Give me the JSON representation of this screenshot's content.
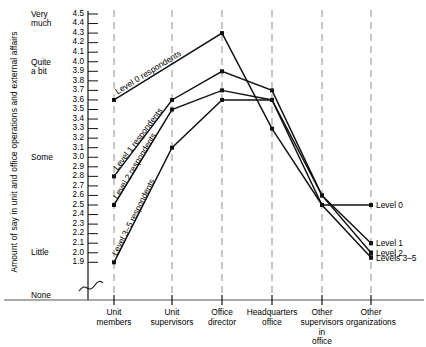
{
  "chart_data": {
    "type": "line",
    "title": "",
    "ylabel": "Amount of say in unit and office operations and external affairs",
    "xlabel": "",
    "ylim": [
      1.9,
      4.5
    ],
    "grid": "vertical dashed gridlines at each category",
    "legend_position": "right, at line ends",
    "axis_break": true,
    "axis_break_symbol": "≈",
    "categories": [
      "Unit members",
      "Unit supervisors",
      "Office director",
      "Headquarters office",
      "Other supervisors in office",
      "Other organizations"
    ],
    "ytick_labels": [
      "4.5",
      "4.4",
      "4.3",
      "4.2",
      "4.1",
      "4.0",
      "3.9",
      "3.8",
      "3.7",
      "3.6",
      "3.5",
      "3.4",
      "3.3",
      "3.2",
      "3.1",
      "3.0",
      "2.9",
      "2.8",
      "2.7",
      "2.6",
      "2.5",
      "2.4",
      "2.3",
      "2.2",
      "2.1",
      "2.0",
      "1.9"
    ],
    "ycategory_anchors": [
      {
        "label_line1": "Very",
        "label_line2": "much",
        "value": 4.45
      },
      {
        "label_line1": "Quite",
        "label_line2": "a bit",
        "value": 3.95
      },
      {
        "label_line1": "Some",
        "label_line2": "",
        "value": 3.0
      },
      {
        "label_line1": "Little",
        "label_line2": "",
        "value": 2.0
      },
      {
        "label_line1": "None",
        "label_line2": "",
        "value": null
      }
    ],
    "series": [
      {
        "name": "Level 0",
        "inline_label": "Level 0 respondents",
        "end_label": "Level 0",
        "values": [
          3.6,
          null,
          4.3,
          3.3,
          2.5,
          2.5
        ]
      },
      {
        "name": "Level 1",
        "inline_label": "Level 1 respondents",
        "end_label": "Level 1",
        "values": [
          2.8,
          3.6,
          3.9,
          3.7,
          2.6,
          2.1
        ]
      },
      {
        "name": "Level 2",
        "inline_label": "Level 2 respondents",
        "end_label": "Level 2",
        "values": [
          2.5,
          3.5,
          3.7,
          3.6,
          2.6,
          2.0
        ]
      },
      {
        "name": "Levels 3-5",
        "inline_label": "Level 3–5 respondents",
        "end_label": "Levels 3–5",
        "values": [
          1.9,
          3.1,
          3.6,
          3.6,
          2.5,
          1.95
        ]
      }
    ]
  },
  "axis": {
    "ytitle": "Amount of say in unit and office operations and external affairs"
  }
}
